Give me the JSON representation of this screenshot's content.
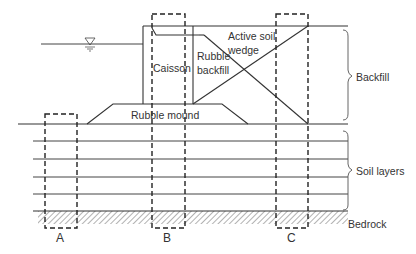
{
  "diagram": {
    "type": "cross-section",
    "labels": {
      "caisson": "Caisson",
      "rubble_backfill_line1": "Rubble",
      "rubble_backfill_line2": "backfill",
      "active_soil_wedge_line1": "Active soil",
      "active_soil_wedge_line2": "wedge",
      "rubble_mound": "Rubble mound",
      "backfill": "Backfill",
      "soil_layers": "Soil layers",
      "bedrock": "Bedrock",
      "column_a": "A",
      "column_b": "B",
      "column_c": "C"
    },
    "icons": {
      "water_level": "water-level-triangle-icon"
    },
    "colors": {
      "line": "#333333",
      "dashed": "#222222",
      "hatch": "#555555",
      "background": "#ffffff"
    },
    "soil_layer_count": 5
  }
}
